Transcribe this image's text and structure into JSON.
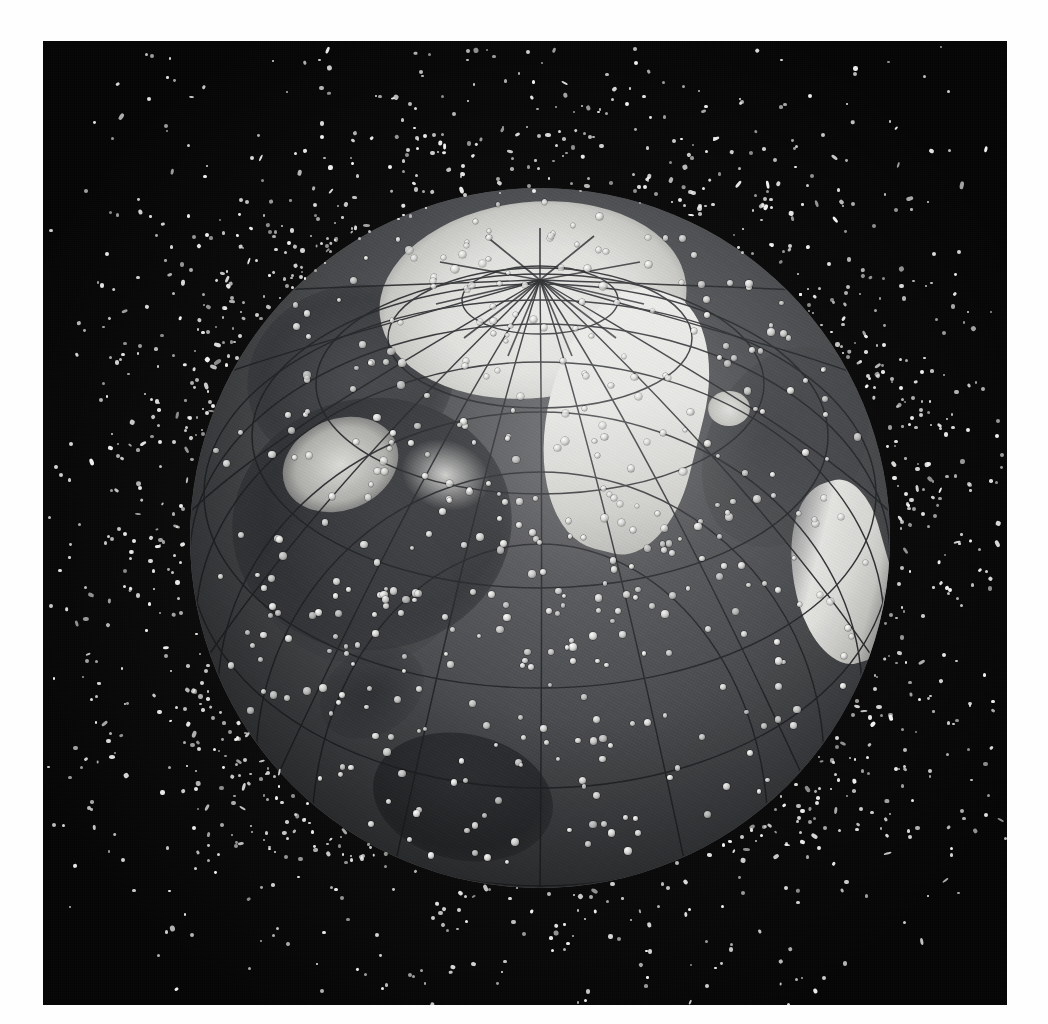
{
  "image": {
    "subject": "Earth surrounded by orbital space debris",
    "view": "North polar view centered near the Arctic, Western Hemisphere visible",
    "medium": "black-and-white printed photographic plate on white page",
    "border_color": "#ffffff",
    "plate_color": "#050505",
    "globe": {
      "ocean_color": "#4d4f52",
      "land_color": "#3b3d40",
      "ice_color": "#e9e9e6",
      "graticule_color": "#2c2e31",
      "center_x": 537,
      "center_y": 538,
      "diameter": 700,
      "pole_x": 540,
      "pole_y": 240,
      "landmasses": [
        "North America",
        "Greenland",
        "Iceland",
        "Central America",
        "South America (northern)",
        "Northern Europe / Scandinavia",
        "Siberia",
        "Arctic sea ice"
      ]
    },
    "debris": {
      "color": "#f2f2f0",
      "surface_dot_color": "#ffffff",
      "orbital_count_visible": 1180,
      "surface_count_visible": 430,
      "distribution": "densest in a shell just above the globe limb, thinning outward with distance"
    }
  },
  "chart_data": {
    "type": "scatter",
    "xlabel": "",
    "ylabel": "",
    "legend": [],
    "annotations": [],
    "series": [
      {
        "name": "Tracked debris objects (space)",
        "values": [
          1180
        ]
      },
      {
        "name": "Objects projected onto Earth disc",
        "values": [
          430
        ]
      }
    ]
  }
}
